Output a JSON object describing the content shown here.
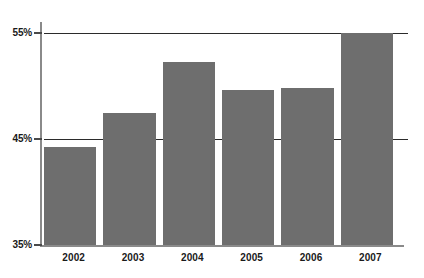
{
  "chart_data": {
    "type": "bar",
    "title": "",
    "xlabel": "",
    "ylabel": "",
    "categories": [
      "2002",
      "2003",
      "2004",
      "2005",
      "2006",
      "2007"
    ],
    "values": [
      44.2,
      47.5,
      52.3,
      49.6,
      49.8,
      55.0
    ],
    "value_labels": [
      "",
      "",
      "",
      "",
      "",
      ""
    ],
    "ylim": [
      35,
      55
    ],
    "ytick_values": [
      35,
      45,
      55
    ],
    "ytick_labels": [
      "35%",
      "45%",
      "55%"
    ],
    "grid": "horizontal",
    "legend": "none",
    "bar_color": "#6e6e6e",
    "gridline_color": "#2b2b2b",
    "axis_color": "#8a8a8a",
    "text_color": "#1a1a1a",
    "background_color": "#ffffff"
  },
  "axes": {
    "y": {
      "ticks": [
        {
          "label": "55%",
          "value": 55
        },
        {
          "label": "45%",
          "value": 45
        },
        {
          "label": "35%",
          "value": 35
        }
      ]
    },
    "x": {
      "ticks": [
        {
          "label": "2002"
        },
        {
          "label": "2003"
        },
        {
          "label": "2004"
        },
        {
          "label": "2005"
        },
        {
          "label": "2006"
        },
        {
          "label": "2007"
        }
      ]
    }
  }
}
